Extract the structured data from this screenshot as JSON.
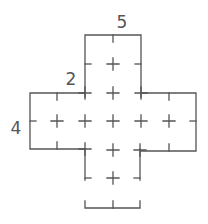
{
  "figure": {
    "type": "cross-shaped grid net",
    "stroke_color": "#555555",
    "background": "#ffffff",
    "labels": {
      "top_width": "5",
      "upper_left_step": "2",
      "left_height": "4"
    }
  }
}
